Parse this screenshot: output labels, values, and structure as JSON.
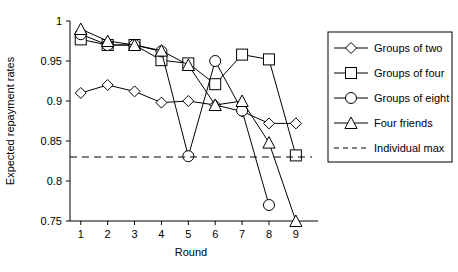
{
  "chart_data": {
    "type": "line",
    "title": "",
    "xlabel": "Round",
    "ylabel": "Expected repayment rates",
    "x": [
      1,
      2,
      3,
      4,
      5,
      6,
      7,
      8,
      9
    ],
    "xticklabels": [
      "1",
      "2",
      "3",
      "4",
      "5",
      "6",
      "7",
      "8",
      "9"
    ],
    "xlim": [
      0.6,
      9.6
    ],
    "ylim": [
      0.75,
      1.0
    ],
    "yticks": [
      0.75,
      0.8,
      0.85,
      0.9,
      0.95,
      1.0
    ],
    "yticklabels": [
      "0.75",
      "0.8",
      "0.85",
      "0.9",
      "0.95",
      "1"
    ],
    "grid": false,
    "legend_position": "right",
    "series": [
      {
        "name": "Groups of two",
        "marker": "diamond",
        "linestyle": "solid",
        "color": "#000000",
        "x": [
          1,
          2,
          3,
          4,
          5,
          6,
          7,
          8,
          9
        ],
        "values": [
          0.91,
          0.92,
          0.912,
          0.898,
          0.9,
          0.895,
          0.887,
          0.872,
          0.872
        ]
      },
      {
        "name": "Groups of four",
        "marker": "square",
        "linestyle": "solid",
        "color": "#000000",
        "x": [
          1,
          2,
          3,
          4,
          5,
          6,
          7,
          8,
          9
        ],
        "values": [
          0.977,
          0.97,
          0.97,
          0.951,
          0.947,
          0.921,
          0.958,
          0.952,
          0.832
        ]
      },
      {
        "name": "Groups of eight",
        "marker": "circle",
        "linestyle": "solid",
        "color": "#000000",
        "x": [
          1,
          2,
          3,
          4,
          5,
          6,
          7,
          8
        ],
        "values": [
          0.9835,
          0.97,
          0.97,
          0.962,
          0.831,
          0.95,
          0.888,
          0.77
        ]
      },
      {
        "name": "Four friends",
        "marker": "triangle",
        "linestyle": "solid",
        "color": "#000000",
        "x": [
          1,
          2,
          3,
          4,
          5,
          6,
          7,
          8,
          9
        ],
        "values": [
          0.99,
          0.975,
          0.97,
          0.963,
          0.945,
          0.895,
          0.9,
          0.848,
          0.75
        ]
      },
      {
        "name": "Individual max",
        "marker": "none",
        "linestyle": "dashed",
        "color": "#000000",
        "constant_value": 0.83,
        "x": [
          0.6,
          9.6
        ],
        "values": [
          0.83,
          0.83
        ]
      }
    ],
    "annotations": []
  },
  "legend": {
    "items": [
      {
        "label": "Groups of two",
        "marker": "diamond",
        "dashed": false
      },
      {
        "label": "Groups of four",
        "marker": "square",
        "dashed": false
      },
      {
        "label": "Groups of eight",
        "marker": "circle",
        "dashed": false
      },
      {
        "label": "Four friends",
        "marker": "triangle",
        "dashed": false
      },
      {
        "label": "Individual max",
        "marker": "none",
        "dashed": true
      }
    ]
  },
  "axes": {
    "y_label": "Expected repayment rates",
    "x_label": "Round",
    "y_ticks": [
      "1",
      "0.95",
      "0.9",
      "0.85",
      "0.8",
      "0.75"
    ],
    "x_ticks": [
      "1",
      "2",
      "3",
      "4",
      "5",
      "6",
      "7",
      "8",
      "9"
    ]
  }
}
